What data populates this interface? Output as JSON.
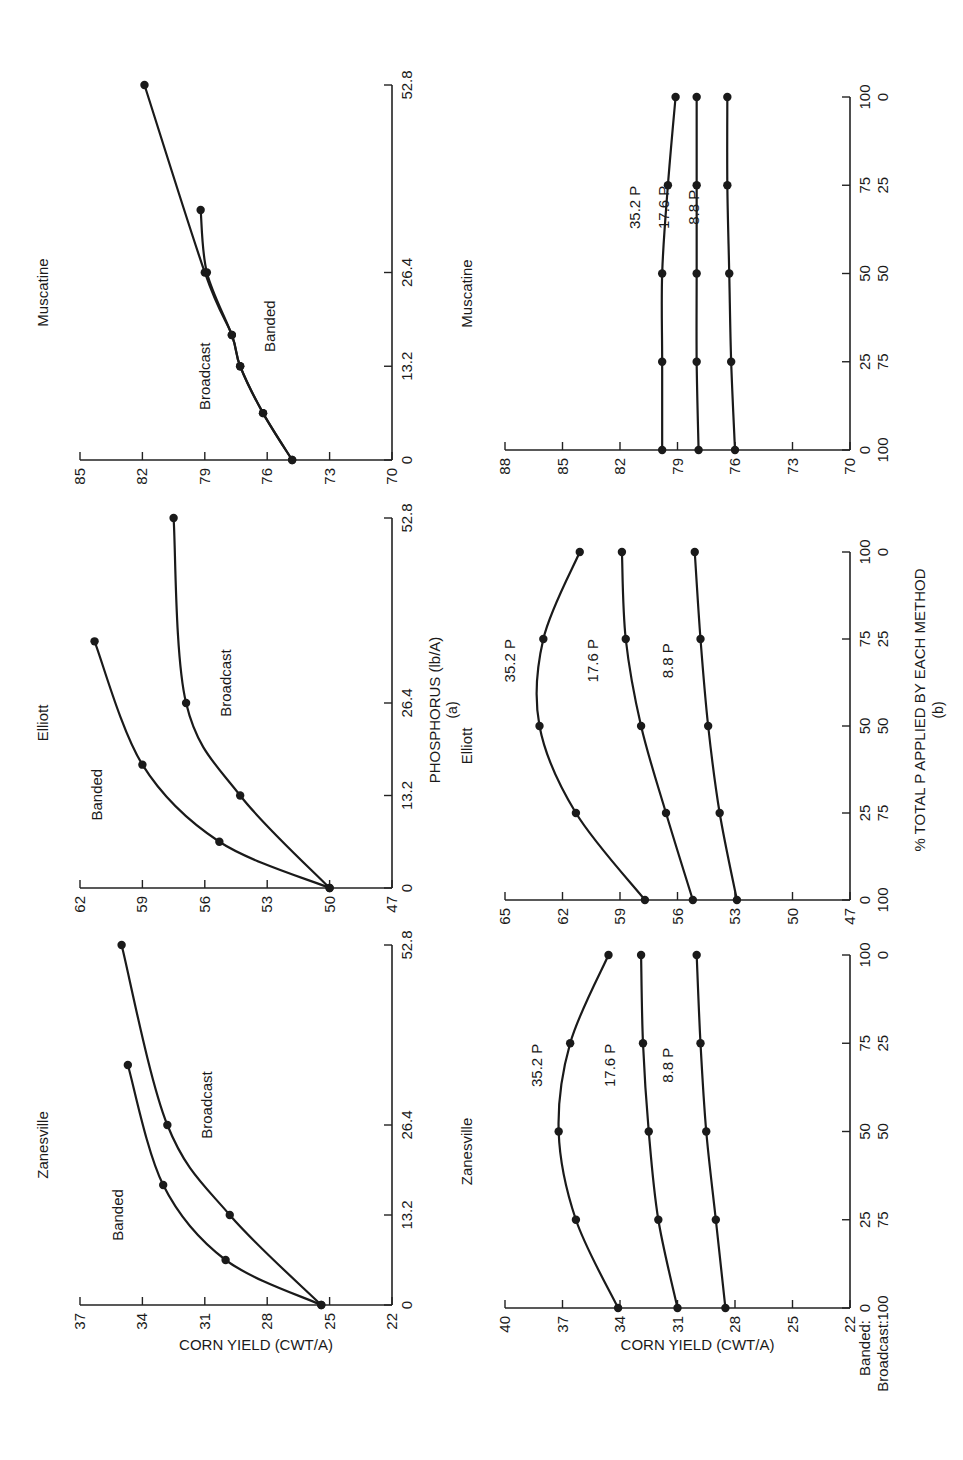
{
  "figure": {
    "row_a_xlabel": "PHOSPHORUS (lb/A)",
    "row_a_tag": "(a)",
    "row_b_xlabel": "% TOTAL P APPLIED BY EACH METHOD",
    "row_b_tag": "(b)",
    "ylabel": "CORN YIELD (CWT/A)",
    "row_b_axis_legend": {
      "banded": "Banded:",
      "broadcast": "Broadcast:"
    }
  },
  "chart_data": [
    {
      "type": "line",
      "title": "Zanesville",
      "panel": "a",
      "xlabel": "PHOSPHORUS (lb/A)",
      "ylabel": "CORN YIELD (CWT/A)",
      "xticks": [
        "0",
        "13.2",
        "26.4",
        "52.8"
      ],
      "yticks": [
        "22",
        "25",
        "28",
        "31",
        "34",
        "37"
      ],
      "xlim": [
        0,
        52.8
      ],
      "ylim": [
        22,
        37
      ],
      "series": [
        {
          "name": "Banded",
          "x": [
            0,
            6.6,
            17.6,
            35.2
          ],
          "values": [
            25.4,
            30.0,
            33.0,
            34.7
          ]
        },
        {
          "name": "Broadcast",
          "x": [
            0,
            13.2,
            26.4,
            52.8
          ],
          "values": [
            25.4,
            29.8,
            32.8,
            35.0
          ]
        }
      ]
    },
    {
      "type": "line",
      "title": "Elliott",
      "panel": "a",
      "xlabel": "PHOSPHORUS (lb/A)",
      "ylabel": "CORN YIELD (CWT/A)",
      "xticks": [
        "0",
        "13.2",
        "26.4",
        "52.8"
      ],
      "yticks": [
        "47",
        "50",
        "53",
        "56",
        "59",
        "62"
      ],
      "xlim": [
        0,
        52.8
      ],
      "ylim": [
        47,
        62
      ],
      "series": [
        {
          "name": "Banded",
          "x": [
            0,
            6.6,
            17.6,
            35.2
          ],
          "values": [
            50.0,
            55.3,
            59.0,
            61.3
          ]
        },
        {
          "name": "Broadcast",
          "x": [
            0,
            13.2,
            26.4,
            52.8
          ],
          "values": [
            50.0,
            54.3,
            56.9,
            57.5
          ]
        }
      ]
    },
    {
      "type": "line",
      "title": "Muscatine",
      "panel": "a",
      "xlabel": "PHOSPHORUS (lb/A)",
      "ylabel": "CORN YIELD (CWT/A)",
      "xticks": [
        "0",
        "13.2",
        "26.4",
        "52.8"
      ],
      "yticks": [
        "70",
        "73",
        "76",
        "79",
        "82",
        "85"
      ],
      "xlim": [
        0,
        52.8
      ],
      "ylim": [
        70,
        85
      ],
      "series": [
        {
          "name": "Banded",
          "x": [
            0,
            6.6,
            13.2,
            17.6,
            26.4,
            35.2
          ],
          "values": [
            74.8,
            76.2,
            77.3,
            77.7,
            78.9,
            79.2
          ]
        },
        {
          "name": "Broadcast",
          "x": [
            0,
            6.6,
            13.2,
            17.6,
            26.4,
            52.8
          ],
          "values": [
            74.8,
            76.2,
            77.3,
            77.7,
            79.0,
            81.9
          ]
        }
      ]
    },
    {
      "type": "line",
      "title": "Zanesville",
      "panel": "b",
      "xlabel": "% TOTAL P APPLIED BY EACH METHOD",
      "ylabel": "CORN YIELD (CWT/A)",
      "categories_banded": [
        "0",
        "25",
        "50",
        "75",
        "100"
      ],
      "categories_broadcast": [
        "100",
        "75",
        "50",
        "25",
        "0"
      ],
      "yticks": [
        "22",
        "25",
        "28",
        "31",
        "34",
        "37",
        "40"
      ],
      "ylim": [
        22,
        40
      ],
      "series": [
        {
          "name": "35.2 P",
          "values": [
            34.1,
            36.3,
            37.2,
            36.6,
            34.6
          ]
        },
        {
          "name": "17.6 P",
          "values": [
            31.0,
            32.0,
            32.5,
            32.8,
            32.9
          ]
        },
        {
          "name": "8.8 P",
          "values": [
            28.5,
            29.0,
            29.5,
            29.8,
            30.0
          ]
        }
      ]
    },
    {
      "type": "line",
      "title": "Elliott",
      "panel": "b",
      "xlabel": "% TOTAL P APPLIED BY EACH METHOD",
      "ylabel": "CORN YIELD (CWT/A)",
      "categories_banded": [
        "0",
        "25",
        "50",
        "75",
        "100"
      ],
      "categories_broadcast": [
        "100",
        "75",
        "50",
        "25",
        "0"
      ],
      "yticks": [
        "47",
        "50",
        "53",
        "56",
        "59",
        "62",
        "65"
      ],
      "ylim": [
        47,
        65
      ],
      "series": [
        {
          "name": "35.2 P",
          "values": [
            57.7,
            61.3,
            63.2,
            63.0,
            61.1
          ]
        },
        {
          "name": "17.6 P",
          "values": [
            55.2,
            56.6,
            57.9,
            58.7,
            58.9
          ]
        },
        {
          "name": "8.8 P",
          "values": [
            52.9,
            53.8,
            54.4,
            54.8,
            55.1
          ]
        }
      ]
    },
    {
      "type": "line",
      "title": "Muscatine",
      "panel": "b",
      "xlabel": "% TOTAL P APPLIED BY EACH METHOD",
      "ylabel": "CORN YIELD (CWT/A)",
      "categories_banded": [
        "0",
        "25",
        "50",
        "75",
        "100"
      ],
      "categories_broadcast": [
        "100",
        "75",
        "50",
        "25",
        "0"
      ],
      "yticks": [
        "70",
        "73",
        "76",
        "79",
        "82",
        "85",
        "88"
      ],
      "ylim": [
        70,
        88
      ],
      "series": [
        {
          "name": "35.2 P",
          "values": [
            79.8,
            79.8,
            79.8,
            79.5,
            79.1
          ]
        },
        {
          "name": "17.6 P",
          "values": [
            77.9,
            78.0,
            78.0,
            78.0,
            78.0
          ]
        },
        {
          "name": "8.8 P",
          "values": [
            76.0,
            76.2,
            76.3,
            76.4,
            76.4
          ]
        }
      ]
    }
  ]
}
